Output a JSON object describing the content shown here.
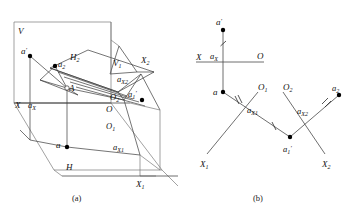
{
  "figure": {
    "type": "descriptive-geometry-projection-diagram",
    "panels": [
      {
        "id": "a",
        "caption": "(a)",
        "description": "pictorial view of projection planes"
      },
      {
        "id": "b",
        "caption": "(b)",
        "description": "unfolded two-dimensional projection diagram"
      }
    ]
  },
  "panel_a": {
    "caption": "(a)",
    "labels": {
      "plane_v": "V",
      "plane_h": "H",
      "plane_h2": "H",
      "plane_h2_sub": "2",
      "plane_v1": "V",
      "plane_v1_sub": "1",
      "axis_x": "X",
      "axis_x1": "X",
      "axis_x1_sub": "1",
      "axis_x2": "X",
      "axis_x2_sub": "2",
      "origin_o": "O",
      "origin_o1": "O",
      "origin_o1_sub": "1",
      "origin_o2": "O",
      "origin_o2_sub": "2",
      "point_a_prime": "a",
      "point_a_prime_mark": "′",
      "point_a": "a",
      "point_a2": "a",
      "point_a2_sub": "2",
      "point_a1_prime": "a",
      "point_a1_prime_sub": "1",
      "point_a1_prime_mark": "′",
      "point_A": "A",
      "trace_ax": "a",
      "trace_ax_sub": "X",
      "trace_ax1": "a",
      "trace_ax1_sub": "X1",
      "trace_ax2": "a",
      "trace_ax2_sub": "X2"
    }
  },
  "panel_b": {
    "caption": "(b)",
    "labels": {
      "axis_x": "X",
      "origin_o": "O",
      "axis_x1": "X",
      "axis_x1_sub": "1",
      "origin_o1": "O",
      "origin_o1_sub": "1",
      "axis_x2": "X",
      "axis_x2_sub": "2",
      "origin_o2": "O",
      "origin_o2_sub": "2",
      "point_a_prime": "a",
      "point_a_prime_mark": "′",
      "point_a": "a",
      "point_a2": "a",
      "point_a2_sub": "2",
      "point_a1_prime": "a",
      "point_a1_prime_sub": "1",
      "point_a1_prime_mark": "′",
      "trace_ax": "a",
      "trace_ax_sub": "X",
      "trace_ax1": "a",
      "trace_ax1_sub": "X1",
      "trace_ax2": "a",
      "trace_ax2_sub": "X2"
    },
    "tick_marks": {
      "single": "|",
      "double": "||"
    }
  }
}
